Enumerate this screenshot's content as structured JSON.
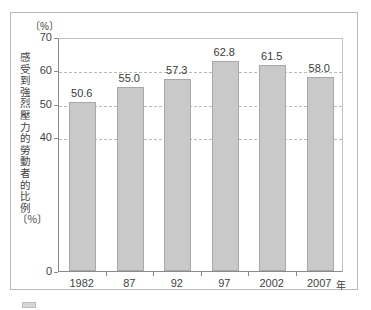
{
  "chart_data": {
    "type": "bar",
    "title": "",
    "unit_label": "〔%〕",
    "categories": [
      "1982",
      "87",
      "92",
      "97",
      "2002",
      "2007"
    ],
    "values": [
      50.6,
      55.0,
      57.3,
      62.8,
      61.5,
      58.0
    ],
    "value_labels": [
      "50.6",
      "55.0",
      "57.3",
      "62.8",
      "61.5",
      "58.0"
    ],
    "xlabel": "年",
    "ylabel": "感受到強烈壓力的勞動者的比例〔％〕",
    "ylim": [
      0,
      70
    ],
    "yticks": [
      70,
      60,
      50,
      40,
      0
    ],
    "ytick_labels": [
      "70",
      "60",
      "50",
      "40",
      "0"
    ],
    "gridlines": [
      60,
      50,
      40
    ],
    "grid": true,
    "legend": "none",
    "bar_color": "#c9c9c9",
    "bar_border_color": "#a8a8a8",
    "axis_color": "#8a8a8a",
    "grid_color": "#b9b9b9",
    "text_color": "#3a3a3a"
  },
  "caption": {
    "text": ""
  }
}
